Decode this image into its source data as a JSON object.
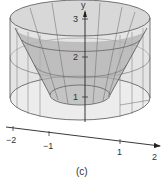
{
  "figure": {
    "caption": "(c)",
    "y_axis": {
      "label": "y",
      "ticks": [
        "1",
        "2",
        "3"
      ]
    },
    "x_axis": {
      "ticks": [
        "−2",
        "−1",
        "1",
        "2"
      ]
    },
    "colors": {
      "outer_fill": "#d9d9d9",
      "inner_fill": "#a8a8a8",
      "line": "#555555",
      "axis": "#222222"
    }
  }
}
